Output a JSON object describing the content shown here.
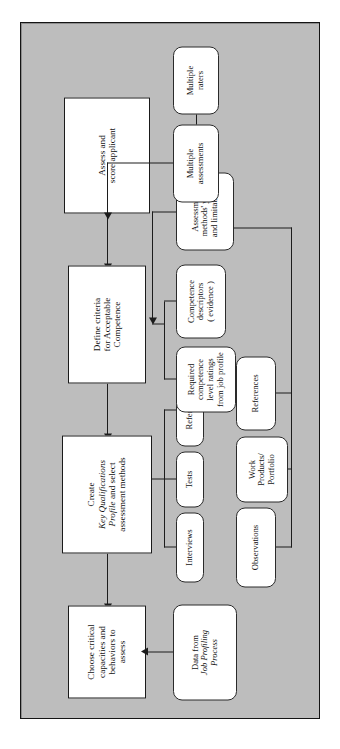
{
  "diagram": {
    "orientation": "rotated-90-ccw",
    "frame_color": "#bdbdbd",
    "border_color": "#141414",
    "node_fill": "#ffffff",
    "line_color": "#1c1c1c"
  },
  "main_flow": {
    "step1": {
      "line1": "Choose critical",
      "line2": "capacities and",
      "line3": "behaviors to",
      "line4": "assess"
    },
    "step2": {
      "line1": "Create",
      "line2": "Key Qualifications",
      "line3_italic": "Profile",
      "line3_rest": " and select",
      "line4": "assessment methods"
    },
    "step3": {
      "line1": "Define criteria",
      "line2": "for Acceptable",
      "line3": "Competence"
    },
    "step4": {
      "line1": "Assess and",
      "line2": "score applicant"
    }
  },
  "inputs": {
    "job_profiling": {
      "line1": "Data from",
      "line2_italic": "Job Profiling",
      "line3_italic": "Process"
    },
    "assessment_yield": {
      "line1": "Assessment",
      "line2": "methods' yield",
      "line3": "and limitations"
    }
  },
  "method_column_a": [
    {
      "label": "Interviews"
    },
    {
      "label": "Tests"
    },
    {
      "label": "References"
    }
  ],
  "method_column_b": [
    {
      "line1": "Observations"
    },
    {
      "line1": "Work",
      "line2": "Products/",
      "line3": "Portfolio"
    },
    {
      "line1": "References"
    }
  ],
  "criteria_inputs": [
    {
      "line1": "Required",
      "line2": "competence",
      "line3": "level ratings",
      "line4": "from job profile"
    },
    {
      "line1": "Competence",
      "line2": "descriptors",
      "line3": "( evidence )"
    }
  ],
  "scoring_inputs": [
    {
      "line1": "Multiple",
      "line2": "assessments"
    },
    {
      "line1": "Multiple",
      "line2": "raters"
    }
  ]
}
